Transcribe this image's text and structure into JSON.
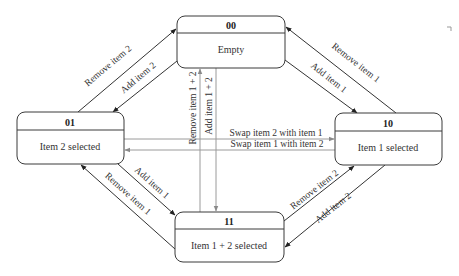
{
  "diagram": {
    "type": "state-machine",
    "states": [
      {
        "id": "00",
        "label": "Empty"
      },
      {
        "id": "01",
        "label": "Item 2 selected"
      },
      {
        "id": "10",
        "label": "Item 1 selected"
      },
      {
        "id": "11",
        "label": "Item 1 + 2 selected"
      }
    ],
    "transitions": [
      {
        "from": "01",
        "to": "00",
        "label": "Remove item 2"
      },
      {
        "from": "00",
        "to": "01",
        "label": "Add item 2"
      },
      {
        "from": "10",
        "to": "00",
        "label": "Remove item 1"
      },
      {
        "from": "00",
        "to": "10",
        "label": "Add item 1"
      },
      {
        "from": "11",
        "to": "00",
        "label": "Remove item 1 + 2"
      },
      {
        "from": "00",
        "to": "11",
        "label": "Add item 1 + 2"
      },
      {
        "from": "01",
        "to": "10",
        "label": "Swap item 2 with item 1"
      },
      {
        "from": "10",
        "to": "01",
        "label": "Swap item 1 with item 2"
      },
      {
        "from": "01",
        "to": "11",
        "label": "Add item 1"
      },
      {
        "from": "11",
        "to": "01",
        "label": "Remove item 1"
      },
      {
        "from": "11",
        "to": "10",
        "label": "Remove item 2"
      },
      {
        "from": "10",
        "to": "11",
        "label": "Add item 2"
      }
    ]
  }
}
